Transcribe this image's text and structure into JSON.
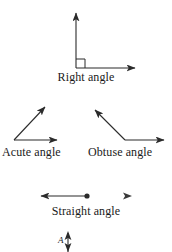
{
  "figure": {
    "background_color": "#ffffff",
    "stroke_color": "#2b2b2b",
    "text_color": "#1a1a1a"
  },
  "angles": [
    {
      "id": "right",
      "caption": "Right angle",
      "vertex": [
        76,
        68
      ],
      "rays": [
        {
          "name": "vertical-ray",
          "to": [
            76,
            11
          ]
        },
        {
          "name": "horizontal-ray",
          "to": [
            137,
            68
          ]
        }
      ],
      "marker": "square",
      "measure_degrees": 90
    },
    {
      "id": "acute",
      "caption": "Acute angle",
      "vertex": [
        14,
        140
      ],
      "rays": [
        {
          "name": "diagonal-ray",
          "to": [
            48,
            104
          ]
        },
        {
          "name": "horizontal-ray",
          "to": [
            60,
            140
          ]
        }
      ],
      "marker": "none",
      "measure_degrees": 46
    },
    {
      "id": "obtuse",
      "caption": "Obtuse angle",
      "vertex": [
        125,
        140
      ],
      "rays": [
        {
          "name": "diagonal-ray",
          "to": [
            92,
            107
          ]
        },
        {
          "name": "horizontal-ray",
          "to": [
            167,
            140
          ]
        }
      ],
      "marker": "none",
      "measure_degrees": 135
    },
    {
      "id": "straight",
      "caption": "Straight angle",
      "vertex": [
        87,
        196
      ],
      "rays": [
        {
          "name": "left-ray",
          "to": [
            38,
            196
          ]
        },
        {
          "name": "right-ray",
          "to": [
            132,
            196
          ]
        }
      ],
      "marker": "dot",
      "measure_degrees": 180
    }
  ],
  "bottom_label": {
    "text": "A",
    "note": "partially cropped point label with vertical double arrow"
  }
}
